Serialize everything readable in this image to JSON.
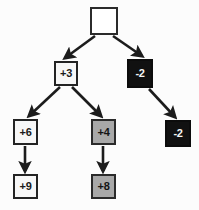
{
  "diagram": {
    "type": "tree",
    "canvas": {
      "width": 199,
      "height": 210,
      "background": "#fcfcfc"
    },
    "styles": {
      "white_fill": "#f7f7f7",
      "gray_fill": "#a8a8a8",
      "black_fill": "#111111",
      "empty_fill": "#ffffff",
      "border": "#232323",
      "edge": "#1c1c1c"
    },
    "nodes": [
      {
        "id": "root",
        "label": "",
        "fill": "empty",
        "x": 90,
        "y": 7,
        "w": 28,
        "h": 28,
        "font": 11
      },
      {
        "id": "n_p3",
        "label": "+3",
        "fill": "white",
        "x": 54,
        "y": 61,
        "w": 24,
        "h": 25,
        "font": 11
      },
      {
        "id": "n_m2a",
        "label": "-2",
        "fill": "black",
        "x": 127,
        "y": 59,
        "w": 26,
        "h": 29,
        "font": 11
      },
      {
        "id": "n_p6",
        "label": "+6",
        "fill": "white",
        "x": 13,
        "y": 119,
        "w": 25,
        "h": 26,
        "font": 11
      },
      {
        "id": "n_p4",
        "label": "+4",
        "fill": "gray",
        "x": 91,
        "y": 119,
        "w": 25,
        "h": 26,
        "font": 11
      },
      {
        "id": "n_m2b",
        "label": "-2",
        "fill": "black",
        "x": 165,
        "y": 120,
        "w": 26,
        "h": 27,
        "font": 11
      },
      {
        "id": "n_p9",
        "label": "+9",
        "fill": "white",
        "x": 13,
        "y": 174,
        "w": 25,
        "h": 25,
        "font": 11
      },
      {
        "id": "n_p8",
        "label": "+8",
        "fill": "gray",
        "x": 91,
        "y": 174,
        "w": 25,
        "h": 25,
        "font": 11
      }
    ],
    "edges": [
      {
        "id": "e_root_p3",
        "from": "root",
        "to": "n_p3",
        "x1": 95,
        "y1": 36,
        "x2": 65,
        "y2": 58
      },
      {
        "id": "e_root_m2a",
        "from": "root",
        "to": "n_m2a",
        "x1": 113,
        "y1": 36,
        "x2": 142,
        "y2": 56
      },
      {
        "id": "e_p3_p6",
        "from": "n_p3",
        "to": "n_p6",
        "x1": 60,
        "y1": 87,
        "x2": 29,
        "y2": 116
      },
      {
        "id": "e_p3_p4",
        "from": "n_p3",
        "to": "n_p4",
        "x1": 72,
        "y1": 87,
        "x2": 101,
        "y2": 116
      },
      {
        "id": "e_m2a_m2b",
        "from": "n_m2a",
        "to": "n_m2b",
        "x1": 149,
        "y1": 89,
        "x2": 175,
        "y2": 117
      },
      {
        "id": "e_p6_p9",
        "from": "n_p6",
        "to": "n_p9",
        "x1": 25,
        "y1": 146,
        "x2": 25,
        "y2": 171
      },
      {
        "id": "e_p4_p8",
        "from": "n_p4",
        "to": "n_p8",
        "x1": 103,
        "y1": 146,
        "x2": 103,
        "y2": 171
      }
    ]
  }
}
